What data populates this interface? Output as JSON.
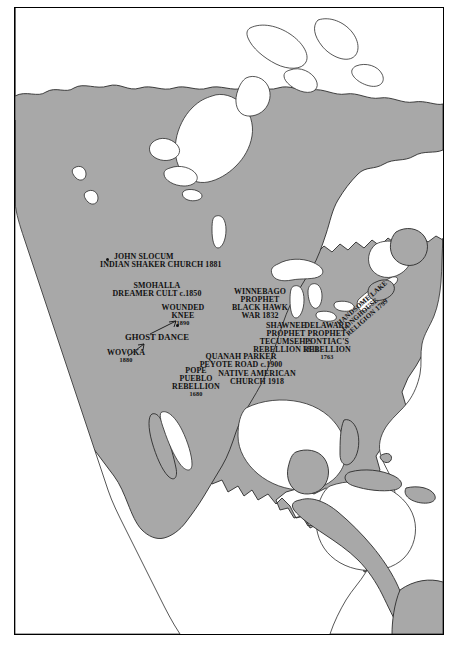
{
  "figure": {
    "kind": "historical-map",
    "region": "North America",
    "frame": true
  },
  "colors": {
    "land": "#a8a8a8",
    "water": "#ffffff",
    "coastline": "#2b2b2b",
    "frame": "#000000",
    "text": "#111111"
  },
  "labels": [
    {
      "id": "john-slocum",
      "name": "label-john-slocum",
      "lines": [
        "JOHN SLOCUM",
        "INDIAN SHAKER CHURCH 1881"
      ],
      "line1": "JOHN SLOCUM",
      "line2": "INDIAN SHAKER CHURCH 1881",
      "marker": true
    },
    {
      "id": "smohalla",
      "name": "label-smohalla",
      "lines": [
        "SMOHALLA",
        "DREAMER CULT  c.1850"
      ],
      "line1": "SMOHALLA",
      "line2": "DREAMER CULT  c.1850",
      "marker": false
    },
    {
      "id": "wounded-knee",
      "name": "label-wounded-knee",
      "lines": [
        "WOUNDED",
        "KNEE",
        "1890"
      ],
      "line1": "WOUNDED",
      "line2": "KNEE",
      "line3": "1890",
      "marker": true
    },
    {
      "id": "ghost-dance",
      "name": "label-ghost-dance",
      "lines": [
        "GHOST DANCE"
      ],
      "line1": "GHOST DANCE",
      "marker": false
    },
    {
      "id": "wovoka",
      "name": "label-wovoka",
      "lines": [
        "WOVOKA",
        "1880"
      ],
      "line1": "WOVOKA",
      "line2": "1880",
      "marker": false
    },
    {
      "id": "pope-pueblo",
      "name": "label-pope-pueblo-rebellion",
      "lines": [
        "POPE",
        "PUEBLO",
        "REBELLION",
        "1680"
      ],
      "line1": "POPE",
      "line2": "PUEBLO",
      "line3": "REBELLION",
      "line4": "1680",
      "marker": false
    },
    {
      "id": "quanah-parker",
      "name": "label-quanah-parker",
      "lines": [
        "QUANAH PARKER",
        "PEYOTE ROAD  c.1900"
      ],
      "line1": "QUANAH PARKER",
      "line2": "PEYOTE ROAD  c.1900",
      "marker": false
    },
    {
      "id": "native-american-church",
      "name": "label-native-american-church",
      "lines": [
        "NATIVE AMERICAN",
        "CHURCH 1918"
      ],
      "line1": "NATIVE AMERICAN",
      "line2": "CHURCH 1918",
      "marker": false
    },
    {
      "id": "winnebago-prophet",
      "name": "label-winnebago-prophet",
      "lines": [
        "WINNEBAGO",
        "PROPHET",
        "BLACK HAWK",
        "WAR 1832"
      ],
      "line1": "WINNEBAGO",
      "line2": "PROPHET",
      "line3": "BLACK HAWK",
      "line4": "WAR 1832",
      "marker": false
    },
    {
      "id": "shawnee-prophet",
      "name": "label-shawnee-prophet",
      "lines": [
        "SHAWNEE",
        "PROPHET",
        "TECUMSEH'S",
        "REBELLION 1811"
      ],
      "line1": "SHAWNEE",
      "line2": "PROPHET",
      "line3": "TECUMSEH'S",
      "line4": "REBELLION 1811",
      "marker": false
    },
    {
      "id": "delaware-prophet",
      "name": "label-delaware-prophet",
      "lines": [
        "DELAWARE",
        "PROPHET",
        "PONTIAC'S",
        "REBELLION",
        "1763"
      ],
      "line1": "DELAWARE",
      "line2": "PROPHET",
      "line3": "PONTIAC'S",
      "line4": "REBELLION",
      "line5": "1763",
      "marker": false
    },
    {
      "id": "handsome-lake",
      "name": "label-handsome-lake",
      "lines": [
        "HANDSOME LAKE",
        "LONGHOUSE",
        "RELIGION 1799"
      ],
      "line1": "HANDSOME LAKE",
      "line2": "LONGHOUSE",
      "line3": "RELIGION 1799",
      "marker": false,
      "rotated": true
    }
  ]
}
